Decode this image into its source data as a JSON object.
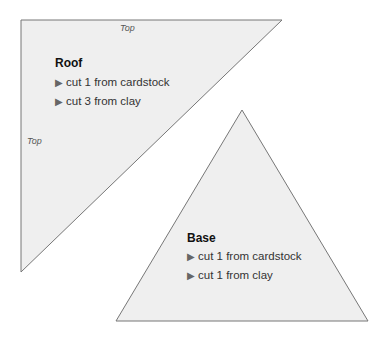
{
  "roof": {
    "top_label_1": "Top",
    "top_label_2": "Top",
    "title": "Roof",
    "items": [
      {
        "bullet": "▶",
        "text": "cut 1 from cardstock"
      },
      {
        "bullet": "▶",
        "text": "cut 3 from clay"
      }
    ]
  },
  "base": {
    "title": "Base",
    "items": [
      {
        "bullet": "▶",
        "text": "cut 1 from cardstock"
      },
      {
        "bullet": "▶",
        "text": "cut 1 from clay"
      }
    ]
  },
  "colors": {
    "fill": "#efefef",
    "stroke": "#777777"
  }
}
